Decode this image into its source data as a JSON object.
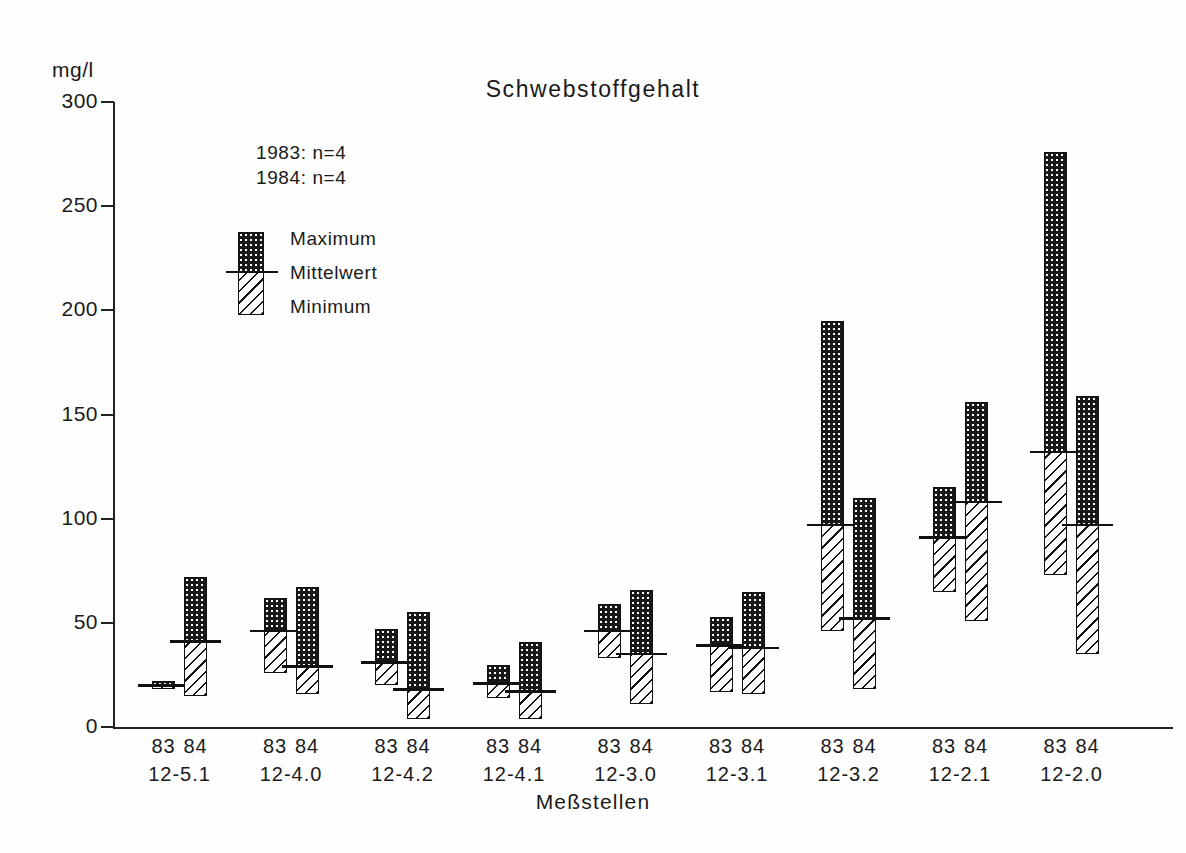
{
  "chart_data": {
    "type": "bar",
    "title": "Schwebstoffgehalt",
    "xlabel": "Meßstellen",
    "ylabel": "mg/l",
    "ylim": [
      0,
      300
    ],
    "yticks": [
      0,
      50,
      100,
      150,
      200,
      250,
      300
    ],
    "ytick_labels": [
      "0",
      "50",
      "100",
      "150",
      "200",
      "250",
      "300"
    ],
    "grid": false,
    "legend_position": "inside-upper-left",
    "categories": [
      "12-5.1",
      "12-4.0",
      "12-4.2",
      "12-4.1",
      "12-3.0",
      "12-3.1",
      "12-3.2",
      "12-2.1",
      "12-2.0"
    ],
    "subcategories": [
      "83",
      "84"
    ],
    "annotations": [
      "1983: n=4",
      "1984: n=4"
    ],
    "legend_entries": [
      "Maximum",
      "Mittelwert",
      "Minimum"
    ],
    "series": [
      {
        "name": "83",
        "year": "1983",
        "n": 4,
        "maximum": [
          22,
          62,
          47,
          30,
          59,
          53,
          195,
          115,
          276
        ],
        "mittelwert": [
          20,
          46,
          31,
          21,
          46,
          39,
          97,
          91,
          132
        ],
        "minimum": [
          18,
          26,
          20,
          14,
          33,
          17,
          46,
          65,
          73
        ]
      },
      {
        "name": "84",
        "year": "1984",
        "n": 4,
        "maximum": [
          72,
          67,
          55,
          41,
          66,
          65,
          110,
          156,
          159
        ],
        "mittelwert": [
          41,
          29,
          18,
          17,
          35,
          38,
          52,
          108,
          97
        ],
        "minimum": [
          15,
          16,
          4,
          4,
          11,
          16,
          18,
          51,
          35
        ]
      }
    ]
  },
  "axis": {
    "unit_label": "mg/l",
    "title": "Schwebstoffgehalt",
    "x_title": "Meßstellen"
  },
  "sample_note": {
    "line1": "1983: n=4",
    "line2": "1984: n=4"
  },
  "legend": {
    "maximum": "Maximum",
    "mittelwert": "Mittelwert",
    "minimum": "Minimum"
  },
  "colors": {
    "ink": "#1a1a1a",
    "max_fill": "#181818",
    "min_fill": "#ffffff",
    "background": "#fefefe"
  }
}
